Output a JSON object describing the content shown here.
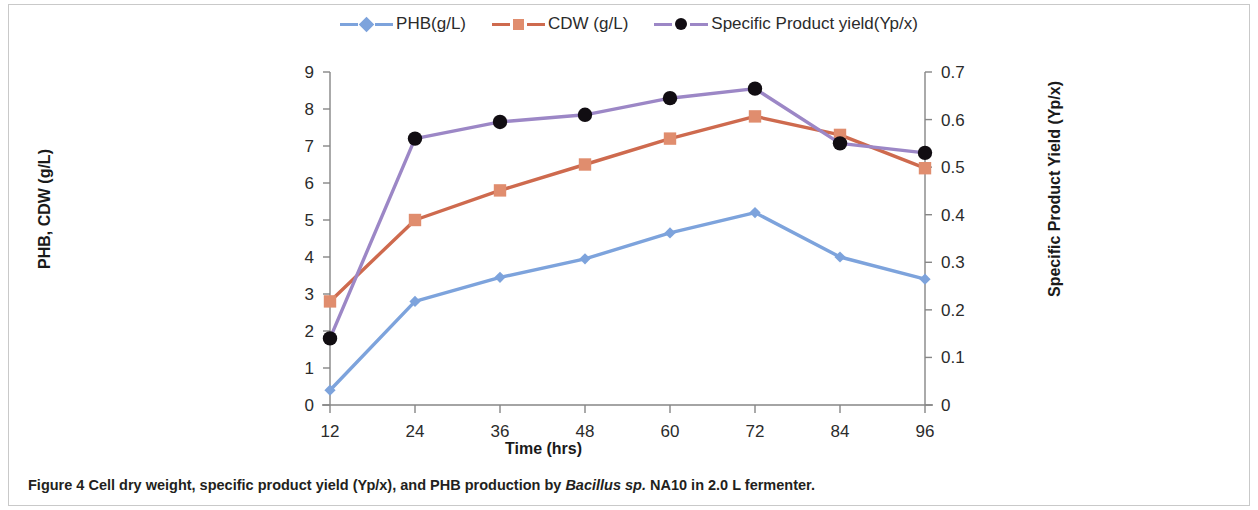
{
  "figure": {
    "caption_label": "Figure 4",
    "caption_text_before": " Cell dry weight, specific product yield (Yp/x), and PHB production by ",
    "caption_italic": "Bacillus sp.",
    "caption_text_after": " NA10 in 2.0 L fermenter."
  },
  "legend": {
    "position": "top-center",
    "items": [
      {
        "label": "PHB(g/L)",
        "color": "#7DA3DC",
        "marker": "diamond-marker-icon"
      },
      {
        "label": "CDW (g/L)",
        "color": "#CE6A4E",
        "marker": "square-marker-icon"
      },
      {
        "label": "Specific Product yield(Yp/x)",
        "color": "#9C87C6",
        "marker": "circle-marker-icon"
      }
    ]
  },
  "axes": {
    "x_title": "Time (hrs)",
    "y_left_title": "PHB, CDW (g/L)",
    "y_right_title": "Specific Product Yield (Yp/x)",
    "x_ticks": [
      "12",
      "24",
      "36",
      "48",
      "60",
      "72",
      "84",
      "96"
    ],
    "y_left_ticks": [
      "0",
      "1",
      "2",
      "3",
      "4",
      "5",
      "6",
      "7",
      "8",
      "9"
    ],
    "y_right_ticks": [
      "0",
      "0.1",
      "0.2",
      "0.3",
      "0.4",
      "0.5",
      "0.6",
      "0.7"
    ]
  },
  "chart_data": {
    "type": "line",
    "title": "",
    "xlabel": "Time (hrs)",
    "ylabel": "PHB, CDW (g/L)",
    "y2label": "Specific Product Yield (Yp/x)",
    "x": [
      12,
      24,
      36,
      48,
      60,
      72,
      84,
      96
    ],
    "categories": [
      "12",
      "24",
      "36",
      "48",
      "60",
      "72",
      "84",
      "96"
    ],
    "xlim": [
      12,
      96
    ],
    "ylim": [
      0,
      9
    ],
    "y2lim": [
      0,
      0.7
    ],
    "grid": false,
    "legend_position": "top-center",
    "series": [
      {
        "name": "PHB(g/L)",
        "axis": "left",
        "color": "#7DA3DC",
        "marker": "diamond",
        "marker_color": "#7DA3DC",
        "values": [
          0.4,
          2.8,
          3.45,
          3.95,
          4.65,
          5.2,
          4.0,
          3.4
        ]
      },
      {
        "name": "CDW (g/L)",
        "axis": "left",
        "color": "#CE6A4E",
        "marker": "square",
        "marker_color": "#E08D6E",
        "values": [
          2.8,
          5.0,
          5.8,
          6.5,
          7.2,
          7.8,
          7.3,
          6.4
        ]
      },
      {
        "name": "Specific Product yield(Yp/x)",
        "axis": "right",
        "color": "#9C87C6",
        "marker": "circle",
        "marker_color": "#110D12",
        "values": [
          0.14,
          0.56,
          0.595,
          0.61,
          0.645,
          0.665,
          0.55,
          0.53
        ]
      }
    ]
  },
  "colors": {
    "phb": "#7DA3DC",
    "cdw_line": "#CE6A4E",
    "cdw_marker": "#E08D6E",
    "yield_line": "#9C87C6",
    "yield_marker": "#110D12",
    "axis": "#868686",
    "text": "#231f20"
  }
}
